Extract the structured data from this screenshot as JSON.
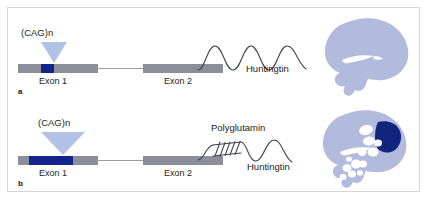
{
  "figure": {
    "type": "scientific-diagram",
    "caption": ""
  },
  "panels": [
    {
      "letter": "a",
      "condition": "normal",
      "gene": {
        "repeat_label": "(CAG)n",
        "exon1_label": "Exon 1",
        "exon2_label": "Exon 2",
        "repeat_width_px": 13,
        "repeat_state": "short"
      },
      "protein": {
        "label": "Huntingtin",
        "has_polyglutamine": false,
        "polyglutamine_label": ""
      },
      "brain": {
        "state": "normal",
        "has_lesion": false,
        "has_vacuoles": false
      }
    },
    {
      "letter": "b",
      "condition": "mutant",
      "gene": {
        "repeat_label": "(CAG)n",
        "exon1_label": "Exon 1",
        "exon2_label": "Exon 2",
        "repeat_width_px": 44,
        "repeat_state": "expanded"
      },
      "protein": {
        "label": "Huntingtin",
        "has_polyglutamine": true,
        "polyglutamine_label": "Polyglutamin"
      },
      "brain": {
        "state": "atrophic",
        "has_lesion": true,
        "has_vacuoles": true
      }
    }
  ],
  "colors": {
    "repeat_navy": "#14248b",
    "exon_gray": "#8c8f99",
    "funnel_blue": "#a9bde4",
    "brain_lavender": "#b3bbdd",
    "brain_lesion": "#12257e",
    "wave_stroke": "#3f4450",
    "frame_border": "#d6d6d6",
    "text": "#1d1d1d",
    "background": "#ffffff"
  }
}
